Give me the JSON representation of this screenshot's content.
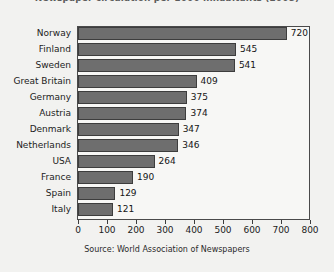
{
  "chart_data": {
    "type": "bar",
    "orientation": "horizontal",
    "title": "Newspaper circulation per 1000 inhabitants (2008)",
    "xlabel": "",
    "ylabel": "",
    "xlim": [
      0,
      800
    ],
    "xticks": [
      0,
      100,
      200,
      300,
      400,
      500,
      600,
      700,
      800
    ],
    "grid": false,
    "legend": null,
    "bar_color": "#6e6e6e",
    "bar_border_color": "#3d3d3d",
    "plot_background": "#f7f7f5",
    "canvas_background": "#f2f2f0",
    "categories": [
      "Norway",
      "Finland",
      "Sweden",
      "Great Britain",
      "Germany",
      "Austria",
      "Denmark",
      "Netherlands",
      "USA",
      "France",
      "Spain",
      "Italy"
    ],
    "values": [
      720,
      545,
      541,
      409,
      375,
      374,
      347,
      346,
      264,
      190,
      129,
      121
    ],
    "value_labels": [
      "720",
      "545",
      "541",
      "409",
      "375",
      "374",
      "347",
      "346",
      "264",
      "190",
      "129",
      "121"
    ],
    "annotations": {
      "source": "Source:  World Association of Newspapers"
    }
  }
}
